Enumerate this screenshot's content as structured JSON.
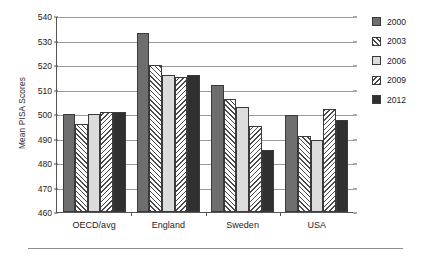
{
  "chart_data": {
    "type": "bar",
    "title": "",
    "xlabel": "",
    "ylabel": "Mean PISA Scores",
    "ylim": [
      460,
      540
    ],
    "ytick_values": [
      460,
      470,
      480,
      490,
      500,
      510,
      520,
      530,
      540
    ],
    "ytick_labels": [
      "460",
      "470",
      "480",
      "490",
      "500",
      "510",
      "520",
      "530",
      "540"
    ],
    "grid": true,
    "legend_position": "right",
    "categories": [
      "OECD/avg",
      "England",
      "Sweden",
      "USA"
    ],
    "series": [
      {
        "name": "2000",
        "values": [
          500,
          533,
          512,
          499.5
        ],
        "swatch": "solid-dark-gray",
        "color": "#6e6e6e"
      },
      {
        "name": "2003",
        "values": [
          496,
          520,
          506,
          491
        ],
        "swatch": "hatch-forward",
        "color": "#ffffff"
      },
      {
        "name": "2006",
        "values": [
          500,
          515.8,
          503,
          489.5
        ],
        "swatch": "solid-light-gray",
        "color": "#dcdcdc"
      },
      {
        "name": "2009",
        "values": [
          501,
          515,
          495,
          502
        ],
        "swatch": "hatch-backward",
        "color": "#ffffff"
      },
      {
        "name": "2012",
        "values": [
          501,
          516,
          485.5,
          497.5
        ],
        "swatch": "solid-black",
        "color": "#303030"
      }
    ]
  }
}
